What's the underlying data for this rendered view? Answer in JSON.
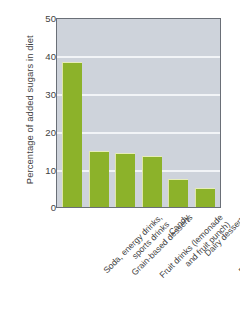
{
  "chart_data": {
    "type": "bar",
    "title": "",
    "xlabel": "",
    "ylabel": "Percentage of added sugars in diet",
    "ylim": [
      0,
      50
    ],
    "yticks": [
      "0",
      "10",
      "20",
      "30",
      "40",
      "50"
    ],
    "grid": true,
    "legend": "none",
    "bar_color": "#8cb22a",
    "plot_background": "#ced3db",
    "gridline_color": "#f2f4f7",
    "categories": [
      "Soda, energy drinks, sports drinks",
      "Grain-based desserts",
      "Fruit drinks (lemonade and fruit punch)",
      "Candy",
      "Dairy desserts",
      "Ready-to-eat cereals"
    ],
    "category_lines": [
      [
        "Soda, energy drinks,",
        "sports drinks"
      ],
      [
        "Grain-based desserts"
      ],
      [
        "Fruit drinks (lemonade",
        "and fruit punch)"
      ],
      [
        "Candy"
      ],
      [
        "Dairy desserts"
      ],
      [
        "Ready-to-eat cereals"
      ]
    ],
    "values": [
      38.5,
      15.0,
      14.3,
      13.7,
      7.5,
      5.0
    ]
  },
  "caption": {
    "text": ""
  }
}
